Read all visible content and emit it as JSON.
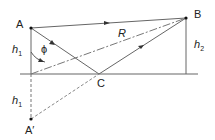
{
  "diagram": {
    "title": "",
    "labels": {
      "A": "A",
      "B": "B",
      "C": "C",
      "A_prime": "A′",
      "R": "R",
      "phi": "ϕ",
      "h1_upper": "h",
      "h1_upper_sub": "1",
      "h1_lower": "h",
      "h1_lower_sub": "1",
      "h2": "h",
      "h2_sub": "2"
    },
    "colors": {
      "line": "#555555",
      "dashed": "#777777",
      "text": "#222222"
    }
  }
}
